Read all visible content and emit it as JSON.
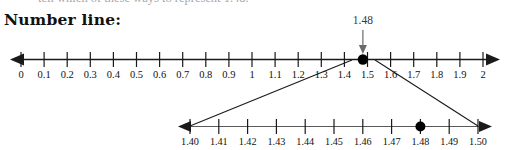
{
  "page": {
    "partial_top_text": "tell which of these ways to represent 1.48.",
    "heading": "Number line:"
  },
  "callout": {
    "label": "1.48",
    "icon": "down-arrow-pointer"
  },
  "chart_data": {
    "type": "line",
    "title": "Number line:",
    "charts": [
      {
        "id": "main-number-line",
        "type": "number-line",
        "xlim": [
          0,
          2
        ],
        "step": 0.1,
        "grid": false,
        "arrows": [
          "left",
          "right"
        ],
        "tick_labels": [
          "0",
          "0.1",
          "0.2",
          "0.3",
          "0.4",
          "0.5",
          "0.6",
          "0.7",
          "0.8",
          "0.9",
          "1",
          "1.1",
          "1.2",
          "1.3",
          "1.4",
          "1.5",
          "1.6",
          "1.7",
          "1.8",
          "1.9",
          "2"
        ],
        "tick_values": [
          0,
          0.1,
          0.2,
          0.3,
          0.4,
          0.5,
          0.6,
          0.7,
          0.8,
          0.9,
          1,
          1.1,
          1.2,
          1.3,
          1.4,
          1.5,
          1.6,
          1.7,
          1.8,
          1.9,
          2
        ],
        "points": [
          {
            "value": 1.48,
            "label": "1.48",
            "marker": "filled-circle"
          }
        ]
      },
      {
        "id": "magnified-number-line",
        "type": "number-line",
        "xlim": [
          1.4,
          1.5
        ],
        "step": 0.01,
        "grid": false,
        "arrows": [
          "left",
          "right"
        ],
        "tick_labels": [
          "1.40",
          "1.41",
          "1.42",
          "1.43",
          "1.44",
          "1.45",
          "1.46",
          "1.47",
          "1.48",
          "1.49",
          "1.50"
        ],
        "tick_values": [
          1.4,
          1.41,
          1.42,
          1.43,
          1.44,
          1.45,
          1.46,
          1.47,
          1.48,
          1.49,
          1.5
        ],
        "points": [
          {
            "value": 1.48,
            "label": "",
            "marker": "filled-circle"
          }
        ]
      }
    ],
    "magnification": {
      "from_range": [
        1.4,
        1.5
      ],
      "to_chart": "magnified-number-line",
      "style": "two-connector-lines"
    },
    "colors": {
      "ink": "#1a1a1a",
      "grey_axis": "#5a5a5a",
      "callout_text": "#3a3a3a",
      "background": "#ffffff"
    }
  }
}
